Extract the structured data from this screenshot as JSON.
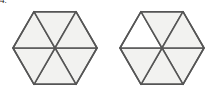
{
  "figure": {
    "label": "4.",
    "background_color": "#ffffff",
    "stroke_color": "#555555",
    "stroke_width": 1.5,
    "shaded_fill_color": "#f2f2f0",
    "unshaded_fill_color": "#ffffff",
    "canvas": {
      "width": 213,
      "height": 96
    },
    "shapes": [
      {
        "name": "left-hexagon",
        "center_x": 55,
        "center_y": 48,
        "radius": 42,
        "orientation": "flat-top",
        "sector_count": 6,
        "shaded_count": 6,
        "fraction": "6/6",
        "sectors": [
          {
            "name": "top-right-sector",
            "index": 0,
            "shaded": true
          },
          {
            "name": "right-sector",
            "index": 1,
            "shaded": true
          },
          {
            "name": "bottom-right-sector",
            "index": 2,
            "shaded": true
          },
          {
            "name": "bottom-left-sector",
            "index": 3,
            "shaded": true
          },
          {
            "name": "left-sector",
            "index": 4,
            "shaded": true
          },
          {
            "name": "top-left-sector",
            "index": 5,
            "shaded": true
          }
        ]
      },
      {
        "name": "right-hexagon",
        "center_x": 162,
        "center_y": 48,
        "radius": 42,
        "orientation": "flat-top",
        "sector_count": 6,
        "shaded_count": 5,
        "fraction": "5/6",
        "sectors": [
          {
            "name": "top-right-sector",
            "index": 0,
            "shaded": true
          },
          {
            "name": "right-sector",
            "index": 1,
            "shaded": true
          },
          {
            "name": "bottom-right-sector",
            "index": 2,
            "shaded": true
          },
          {
            "name": "bottom-left-sector",
            "index": 3,
            "shaded": false
          },
          {
            "name": "left-sector",
            "index": 4,
            "shaded": true
          },
          {
            "name": "top-left-sector",
            "index": 5,
            "shaded": true
          }
        ]
      }
    ]
  }
}
